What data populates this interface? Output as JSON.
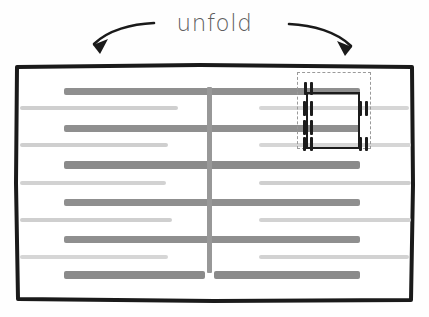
{
  "caption": {
    "label": "unfold"
  },
  "arrows": [
    {
      "name": "unfold-arrow-left",
      "direction": "down-left",
      "icon": "curved-arrow-left-icon",
      "color": "#1a1a1a"
    },
    {
      "name": "unfold-arrow-right",
      "direction": "down-right",
      "icon": "curved-arrow-right-icon",
      "color": "#1a1a1a"
    }
  ],
  "page": {
    "border_color": "#1a1a1a",
    "background_color": "#ffffff",
    "left": 14,
    "top": 63,
    "width": 401,
    "height": 240
  },
  "fold_line": {
    "name": "vertical-fold-line",
    "color": "#989898",
    "x": 193,
    "top": 24,
    "height": 186,
    "thickness": 5
  },
  "text_lines": [
    {
      "weight": "bold",
      "y": 25,
      "left": 50,
      "width": 296,
      "height": 7,
      "color": "#8f8f8f"
    },
    {
      "weight": "light",
      "y": 43,
      "left": 6,
      "width": 158,
      "height": 4,
      "color": "#cfcfcf"
    },
    {
      "weight": "light",
      "y": 43,
      "left": 245,
      "width": 150,
      "height": 4,
      "color": "#d6d6d6"
    },
    {
      "weight": "bold",
      "y": 62,
      "left": 50,
      "width": 296,
      "height": 7,
      "color": "#8f8f8f"
    },
    {
      "weight": "light",
      "y": 80,
      "left": 6,
      "width": 148,
      "height": 4,
      "color": "#cfcfcf"
    },
    {
      "weight": "light",
      "y": 80,
      "left": 245,
      "width": 152,
      "height": 4,
      "color": "#d6d6d6"
    },
    {
      "weight": "bold",
      "y": 98,
      "left": 50,
      "width": 296,
      "height": 8,
      "color": "#8a8a8a"
    },
    {
      "weight": "light",
      "y": 118,
      "left": 6,
      "width": 146,
      "height": 4,
      "color": "#d2d2d2"
    },
    {
      "weight": "light",
      "y": 118,
      "left": 245,
      "width": 152,
      "height": 4,
      "color": "#cfcfcf"
    },
    {
      "weight": "bold",
      "y": 136,
      "left": 50,
      "width": 296,
      "height": 7,
      "color": "#8f8f8f"
    },
    {
      "weight": "light",
      "y": 155,
      "left": 6,
      "width": 152,
      "height": 4,
      "color": "#cfcfcf"
    },
    {
      "weight": "light",
      "y": 155,
      "left": 245,
      "width": 152,
      "height": 4,
      "color": "#d2d2d2"
    },
    {
      "weight": "bold",
      "y": 173,
      "left": 50,
      "width": 296,
      "height": 7,
      "color": "#8f8f8f"
    },
    {
      "weight": "light",
      "y": 192,
      "left": 6,
      "width": 148,
      "height": 4,
      "color": "#d6d6d6"
    },
    {
      "weight": "light",
      "y": 192,
      "left": 245,
      "width": 150,
      "height": 4,
      "color": "#d2d2d2"
    },
    {
      "weight": "bold",
      "y": 208,
      "left": 50,
      "width": 141,
      "height": 8,
      "color": "#8a8a8a"
    },
    {
      "weight": "bold",
      "y": 208,
      "left": 200,
      "width": 146,
      "height": 8,
      "color": "#8a8a8a"
    }
  ],
  "selection": {
    "name": "dashed-selection-box",
    "left": 283,
    "top": 9,
    "width": 74,
    "height": 77,
    "border_color": "#9a9a9a",
    "border_style": "dashed",
    "ticks": [
      {
        "x": 6,
        "y": 9,
        "w": 3,
        "h": 13
      },
      {
        "x": 12,
        "y": 9,
        "w": 3,
        "h": 13
      },
      {
        "x": 5,
        "y": 28,
        "w": 3,
        "h": 15
      },
      {
        "x": 12,
        "y": 28,
        "w": 3,
        "h": 15
      },
      {
        "x": 5,
        "y": 47,
        "w": 3,
        "h": 15
      },
      {
        "x": 12,
        "y": 47,
        "w": 3,
        "h": 15
      },
      {
        "x": 5,
        "y": 64,
        "w": 3,
        "h": 14
      },
      {
        "x": 12,
        "y": 64,
        "w": 3,
        "h": 14
      },
      {
        "x": 61,
        "y": 28,
        "w": 3,
        "h": 15
      },
      {
        "x": 67,
        "y": 28,
        "w": 3,
        "h": 15
      },
      {
        "x": 61,
        "y": 64,
        "w": 3,
        "h": 14
      },
      {
        "x": 67,
        "y": 64,
        "w": 3,
        "h": 14
      }
    ],
    "brackets": [
      {
        "x": 8,
        "y": 19,
        "w": 54,
        "h": 2
      },
      {
        "x": 8,
        "y": 74,
        "w": 54,
        "h": 2
      },
      {
        "x": 8,
        "y": 19,
        "w": 2,
        "h": 57
      },
      {
        "x": 60,
        "y": 19,
        "w": 2,
        "h": 57
      }
    ]
  }
}
